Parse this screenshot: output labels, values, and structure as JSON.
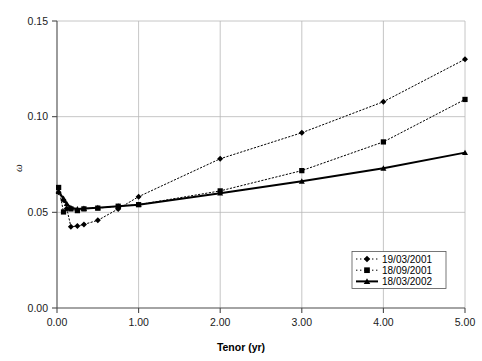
{
  "chart_data": {
    "type": "line",
    "title": "",
    "xlabel": "Tenor (yr)",
    "ylabel": "ω",
    "xlim": [
      0.0,
      5.0
    ],
    "ylim": [
      0.0,
      0.15
    ],
    "xticks": [
      "0.00",
      "1.00",
      "2.00",
      "3.00",
      "4.00",
      "5.00"
    ],
    "xtick_values": [
      0.0,
      1.0,
      2.0,
      3.0,
      4.0,
      5.0
    ],
    "yticks": [
      "0.00",
      "0.05",
      "0.10",
      "0.15"
    ],
    "ytick_values": [
      0.0,
      0.05,
      0.1,
      0.15
    ],
    "grid": true,
    "legend_position": "lower-right",
    "series": [
      {
        "name": "19/03/2001",
        "marker": "diamond",
        "linestyle": "dotted",
        "color": "#000000",
        "points": [
          [
            0.02,
            0.0605
          ],
          [
            0.08,
            0.0565
          ],
          [
            0.12,
            0.052
          ],
          [
            0.17,
            0.0425
          ],
          [
            0.25,
            0.0428
          ],
          [
            0.33,
            0.0437
          ],
          [
            0.5,
            0.0458
          ],
          [
            0.75,
            0.0518
          ],
          [
            1.0,
            0.0582
          ],
          [
            2.0,
            0.078
          ],
          [
            3.0,
            0.0916
          ],
          [
            4.0,
            0.1078
          ],
          [
            5.0,
            0.13
          ]
        ]
      },
      {
        "name": "18/09/2001",
        "marker": "square",
        "linestyle": "dotted",
        "color": "#000000",
        "points": [
          [
            0.02,
            0.063
          ],
          [
            0.08,
            0.0502
          ],
          [
            0.17,
            0.0518
          ],
          [
            0.25,
            0.0509
          ],
          [
            0.33,
            0.0518
          ],
          [
            0.5,
            0.0522
          ],
          [
            0.75,
            0.0532
          ],
          [
            1.0,
            0.054
          ],
          [
            2.0,
            0.0612
          ],
          [
            3.0,
            0.0718
          ],
          [
            4.0,
            0.0868
          ],
          [
            5.0,
            0.109
          ]
        ]
      },
      {
        "name": "18/03/2002",
        "marker": "triangle",
        "linestyle": "solid",
        "color": "#000000",
        "points": [
          [
            0.02,
            0.0608
          ],
          [
            0.08,
            0.0572
          ],
          [
            0.12,
            0.0545
          ],
          [
            0.17,
            0.0524
          ],
          [
            0.25,
            0.0518
          ],
          [
            0.33,
            0.052
          ],
          [
            0.5,
            0.0524
          ],
          [
            0.75,
            0.0532
          ],
          [
            1.0,
            0.054
          ],
          [
            2.0,
            0.06
          ],
          [
            3.0,
            0.0662
          ],
          [
            4.0,
            0.073
          ],
          [
            5.0,
            0.0812
          ]
        ]
      }
    ]
  },
  "legend": {
    "entries": [
      {
        "label": "19/03/2001"
      },
      {
        "label": "18/09/2001"
      },
      {
        "label": "18/03/2002"
      }
    ]
  }
}
